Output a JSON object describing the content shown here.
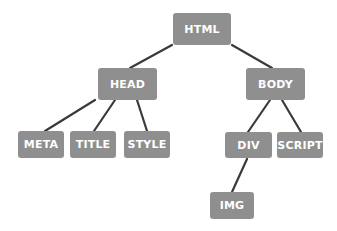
{
  "diagram": {
    "type": "tree",
    "colors": {
      "node_fill": "#8f8f8f",
      "node_text": "#ffffff",
      "edge": "#3a3a3a",
      "background": "#ffffff"
    },
    "nodes": [
      {
        "id": "html",
        "label": "HTML",
        "x": 173,
        "y": 13,
        "w": 58,
        "h": 32
      },
      {
        "id": "head",
        "label": "HEAD",
        "x": 98,
        "y": 68,
        "w": 59,
        "h": 32
      },
      {
        "id": "body",
        "label": "BODY",
        "x": 246,
        "y": 68,
        "w": 59,
        "h": 32
      },
      {
        "id": "meta",
        "label": "META",
        "x": 18,
        "y": 131,
        "w": 46,
        "h": 27
      },
      {
        "id": "title",
        "label": "TITLE",
        "x": 70,
        "y": 131,
        "w": 46,
        "h": 27
      },
      {
        "id": "style",
        "label": "STYLE",
        "x": 124,
        "y": 131,
        "w": 46,
        "h": 27
      },
      {
        "id": "div",
        "label": "DIV",
        "x": 225,
        "y": 132,
        "w": 47,
        "h": 26
      },
      {
        "id": "script",
        "label": "SCRIPT",
        "x": 277,
        "y": 132,
        "w": 46,
        "h": 26
      },
      {
        "id": "img",
        "label": "IMG",
        "x": 210,
        "y": 192,
        "w": 44,
        "h": 27
      }
    ],
    "edges": [
      {
        "from": "html",
        "to": "head",
        "x1": 172,
        "y1": 45,
        "x2": 130,
        "y2": 68
      },
      {
        "from": "html",
        "to": "body",
        "x1": 232,
        "y1": 45,
        "x2": 272,
        "y2": 68
      },
      {
        "from": "head",
        "to": "meta",
        "x1": 95,
        "y1": 100,
        "x2": 45,
        "y2": 131
      },
      {
        "from": "head",
        "to": "title",
        "x1": 115,
        "y1": 100,
        "x2": 94,
        "y2": 131
      },
      {
        "from": "head",
        "to": "style",
        "x1": 137,
        "y1": 100,
        "x2": 147,
        "y2": 131
      },
      {
        "from": "body",
        "to": "div",
        "x1": 270,
        "y1": 100,
        "x2": 248,
        "y2": 132
      },
      {
        "from": "body",
        "to": "script",
        "x1": 282,
        "y1": 100,
        "x2": 301,
        "y2": 132
      },
      {
        "from": "div",
        "to": "img",
        "x1": 247,
        "y1": 159,
        "x2": 232,
        "y2": 192
      }
    ]
  }
}
